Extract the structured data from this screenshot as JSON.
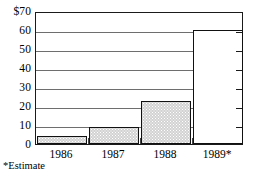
{
  "chart_data": {
    "type": "bar",
    "title": "",
    "subtitle": "",
    "xlabel": "",
    "ylabel": "",
    "categories": [
      "1986",
      "1987",
      "1988",
      "1989*"
    ],
    "values": [
      4,
      9,
      22.5,
      60
    ],
    "ylim": [
      0,
      70
    ],
    "yticks": [
      0,
      10,
      20,
      30,
      40,
      50,
      60,
      70
    ],
    "ytick_labels": [
      "0",
      "10",
      "20",
      "30",
      "40",
      "50",
      "60",
      "$70"
    ],
    "grid": true,
    "legend": null,
    "annotations": [
      "*Estimate"
    ],
    "series": [
      {
        "name": "",
        "values": [
          4,
          9,
          22.5,
          60
        ],
        "bar_styles": [
          "filled",
          "filled",
          "filled",
          "hollow"
        ]
      }
    ],
    "colors": {
      "bar_fill": "#d2d2d2",
      "bar_edge": "#111111",
      "hollow_fill": "#ffffff",
      "gridline": "#6e6e6e",
      "frame": "#1a1a1a",
      "text": "#000000"
    }
  },
  "footnote": {
    "text": "*Estimate"
  }
}
